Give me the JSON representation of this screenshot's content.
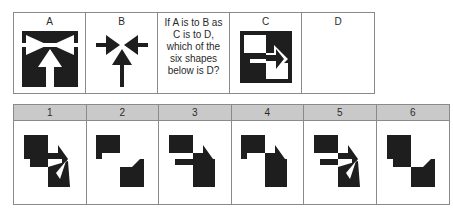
{
  "puzzle": {
    "top_cells": [
      {
        "label": "A",
        "figure": "boxed-three-arrows-inward-icon"
      },
      {
        "label": "B",
        "figure": "three-arrows-inward-icon"
      },
      {
        "question": "If A is to B as C is to D, which of the six shapes below is D?"
      },
      {
        "label": "C",
        "figure": "boxed-checker-arrow-icon"
      },
      {
        "label": "D",
        "figure": "empty"
      }
    ],
    "options": [
      {
        "label": "1",
        "figure": "option-1-shape"
      },
      {
        "label": "2",
        "figure": "option-2-shape"
      },
      {
        "label": "3",
        "figure": "option-3-shape"
      },
      {
        "label": "4",
        "figure": "option-4-shape"
      },
      {
        "label": "5",
        "figure": "option-5-shape"
      },
      {
        "label": "6",
        "figure": "option-6-shape"
      }
    ],
    "colors": {
      "ink": "#1e1e1e",
      "header_bg": "#c9c9c9",
      "border": "#8a8a8a"
    }
  }
}
